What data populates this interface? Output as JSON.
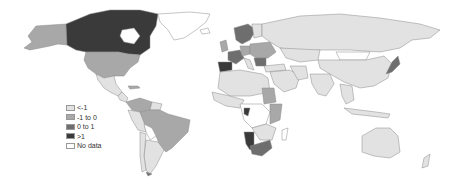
{
  "map": {
    "type": "choropleth world map",
    "colors": {
      "lt_minus1": "#e2e2e2",
      "minus1_to_0": "#a8a8a8",
      "0_to_1": "#6e6e6e",
      "gt_1": "#3a3a3a",
      "no_data": "#ffffff",
      "border": "#8a8a8a"
    },
    "regions": [
      {
        "name": "Canada",
        "category": "gt_1"
      },
      {
        "name": "Alaska (USA)",
        "category": "minus1_to_0"
      },
      {
        "name": "United States",
        "category": "minus1_to_0"
      },
      {
        "name": "Greenland",
        "category": "no_data"
      },
      {
        "name": "Mexico",
        "category": "lt_minus1"
      },
      {
        "name": "Brazil",
        "category": "minus1_to_0"
      },
      {
        "name": "Colombia",
        "category": "minus1_to_0"
      },
      {
        "name": "Argentina",
        "category": "lt_minus1"
      },
      {
        "name": "Spain",
        "category": "gt_1"
      },
      {
        "name": "France",
        "category": "0_to_1"
      },
      {
        "name": "Russia",
        "category": "lt_minus1"
      },
      {
        "name": "China",
        "category": "lt_minus1"
      },
      {
        "name": "India",
        "category": "lt_minus1"
      },
      {
        "name": "Australia",
        "category": "lt_minus1"
      },
      {
        "name": "Namibia",
        "category": "gt_1"
      },
      {
        "name": "South Africa",
        "category": "0_to_1"
      },
      {
        "name": "Sudan",
        "category": "minus1_to_0"
      },
      {
        "name": "Japan",
        "category": "0_to_1"
      }
    ]
  },
  "legend": {
    "items": [
      {
        "label": "<-1",
        "color": "#e2e2e2"
      },
      {
        "label": "-1 to 0",
        "color": "#a8a8a8"
      },
      {
        "label": "0 to 1",
        "color": "#6e6e6e"
      },
      {
        "label": ">1",
        "color": "#3a3a3a"
      },
      {
        "label": "No data",
        "color": "#ffffff"
      }
    ]
  }
}
